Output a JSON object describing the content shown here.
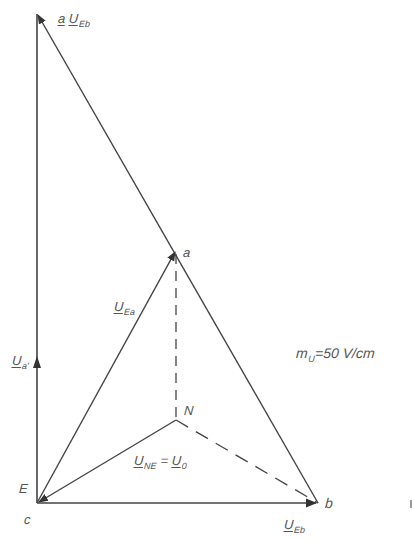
{
  "diagram": {
    "type": "phasor-diagram",
    "scale_label": {
      "symbol": "m",
      "subscript": "U",
      "value": "=50 V/cm"
    },
    "points": [
      {
        "id": "a",
        "label": "a",
        "x": 176,
        "y": 250
      },
      {
        "id": "N",
        "label": "N",
        "x": 176,
        "y": 420
      },
      {
        "id": "E",
        "label": "E",
        "x": 37,
        "y": 503
      },
      {
        "id": "c",
        "label": "c",
        "x": 37,
        "y": 503
      },
      {
        "id": "b",
        "label": "b",
        "x": 318,
        "y": 503
      },
      {
        "id": "top",
        "label": "",
        "x": 37,
        "y": 14
      }
    ],
    "phasors": [
      {
        "id": "aUEb",
        "prefix": "a",
        "symbol": "U",
        "subscript": "Eb",
        "from": "b",
        "to": "top",
        "style": "solid-arrow"
      },
      {
        "id": "UEa",
        "symbol": "U",
        "subscript": "Ea",
        "from": "E",
        "to": "a",
        "style": "solid-arrow"
      },
      {
        "id": "Ua",
        "symbol": "U",
        "subscript": "a",
        "prime": "'",
        "from": "E",
        "to": "top",
        "style": "solid-arrow"
      },
      {
        "id": "UNE",
        "symbol": "U",
        "subscript": "NE",
        "equals": "=",
        "alt_symbol": "U",
        "alt_subscript": "0",
        "from": "N",
        "to": "E",
        "style": "solid-arrow"
      },
      {
        "id": "UEb",
        "symbol": "U",
        "subscript": "Eb",
        "from": "E",
        "to": "b",
        "style": "solid-arrow"
      }
    ],
    "dashed_lines": [
      {
        "from": "a",
        "to": "N"
      },
      {
        "from": "N",
        "to": "b"
      }
    ],
    "colors": {
      "line": "#333333",
      "text": "#555555",
      "background": "#ffffff"
    }
  },
  "labels": {
    "aUEb_prefix": "a",
    "aUEb_sym": "U",
    "aUEb_sub": "Eb",
    "UEa_sym": "U",
    "UEa_sub": "Ea",
    "Ua_sym": "U",
    "Ua_sub": "a'",
    "UNE_sym": "U",
    "UNE_sub": "NE",
    "UNE_eq": "=",
    "U0_sym": "U",
    "U0_sub": "0",
    "UEb_sym": "U",
    "UEb_sub": "Eb",
    "pt_a": "a",
    "pt_N": "N",
    "pt_E": "E",
    "pt_c": "c",
    "pt_b": "b",
    "scale_m": "m",
    "scale_sub": "U",
    "scale_val": "=50 V/cm"
  }
}
